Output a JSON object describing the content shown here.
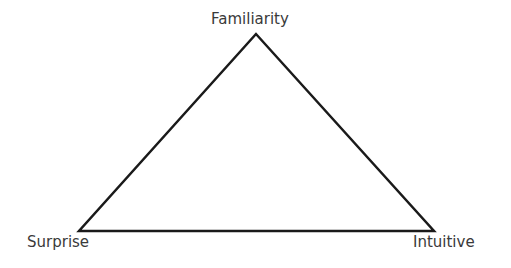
{
  "diagram": {
    "type": "triangle",
    "vertices": [
      {
        "label": "Familiarity",
        "position": "top"
      },
      {
        "label": "Surprise",
        "position": "bottom-left"
      },
      {
        "label": "Intuitive",
        "position": "bottom-right"
      }
    ],
    "stroke_color": "#1a1a1a",
    "text_color": "#3a3a3a"
  }
}
